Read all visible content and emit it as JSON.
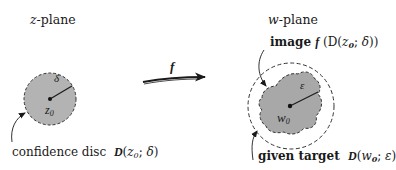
{
  "z_plane": {
    "title_var": "z",
    "title_suffix": "-plane",
    "disc": {
      "center_label_base": "z",
      "center_label_sub": "0",
      "radius_label": "δ",
      "fill_color": "#b3b3b3",
      "stroke_color": "#333333"
    },
    "caption": {
      "text": "confidence disc",
      "math_prefix": "D",
      "math_open": "(",
      "math_var": "z",
      "math_sub": "0",
      "math_sep": "; ",
      "math_param": "δ",
      "math_close": ")"
    }
  },
  "mapping": {
    "label": "f"
  },
  "w_plane": {
    "title_var": "w",
    "title_suffix": "-plane",
    "image_label": {
      "text": "image",
      "math": "f",
      "math_open": " (D(",
      "math_var": "z",
      "math_sub": "0",
      "math_sep": "; ",
      "math_param": "δ",
      "math_close": "))"
    },
    "region": {
      "center_label_base": "w",
      "center_label_sub": "0",
      "radius_label": "ε",
      "fill_color": "#a8a8a8",
      "stroke_color": "#333333"
    },
    "caption": {
      "text": "given target",
      "math_prefix": "D",
      "math_open": "(",
      "math_var": "w",
      "math_sub": "0",
      "math_sep": "; ",
      "math_param": "ε",
      "math_close": ")"
    }
  }
}
